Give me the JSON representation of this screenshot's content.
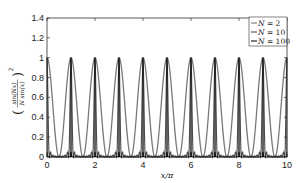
{
  "chart_data": {
    "type": "line",
    "title": "",
    "xlabel": "x/π",
    "ylabel": "(sin(Nx) / (N sin(x)))²",
    "xlim": [
      0,
      10
    ],
    "ylim": [
      0,
      1.4
    ],
    "xticks": [
      0,
      2,
      4,
      6,
      8,
      10
    ],
    "yticks": [
      0,
      0.2,
      0.4,
      0.6,
      0.8,
      1,
      1.2,
      1.4
    ],
    "grid": false,
    "legend_position": "upper right",
    "function": "y = (sin(N·x) / (N·sin(x)))^2, x in units of π",
    "series": [
      {
        "name": "N = 2",
        "N": 2,
        "color": "#7a7a7a",
        "width": 1.3,
        "peaks_at": [
          0,
          1,
          2,
          3,
          4,
          5,
          6,
          7,
          8,
          9,
          10
        ],
        "peak_value": 1
      },
      {
        "name": "N = 10",
        "N": 10,
        "color": "#4a4a4a",
        "width": 1.1,
        "peaks_at": [
          0,
          1,
          2,
          3,
          4,
          5,
          6,
          7,
          8,
          9,
          10
        ],
        "peak_value": 1
      },
      {
        "name": "N = 100",
        "N": 100,
        "color": "#111111",
        "width": 0.8,
        "peaks_at": [
          0,
          1,
          2,
          3,
          4,
          5,
          6,
          7,
          8,
          9,
          10
        ],
        "peak_value": 1
      }
    ]
  },
  "legend": {
    "items": [
      "N = 2",
      "N = 10",
      "N = 100"
    ]
  },
  "axes": {
    "x_label": "x/π",
    "y_label_num": "sin(Nx)",
    "y_label_den": "N sin(x)",
    "y_label_exp": "2"
  }
}
